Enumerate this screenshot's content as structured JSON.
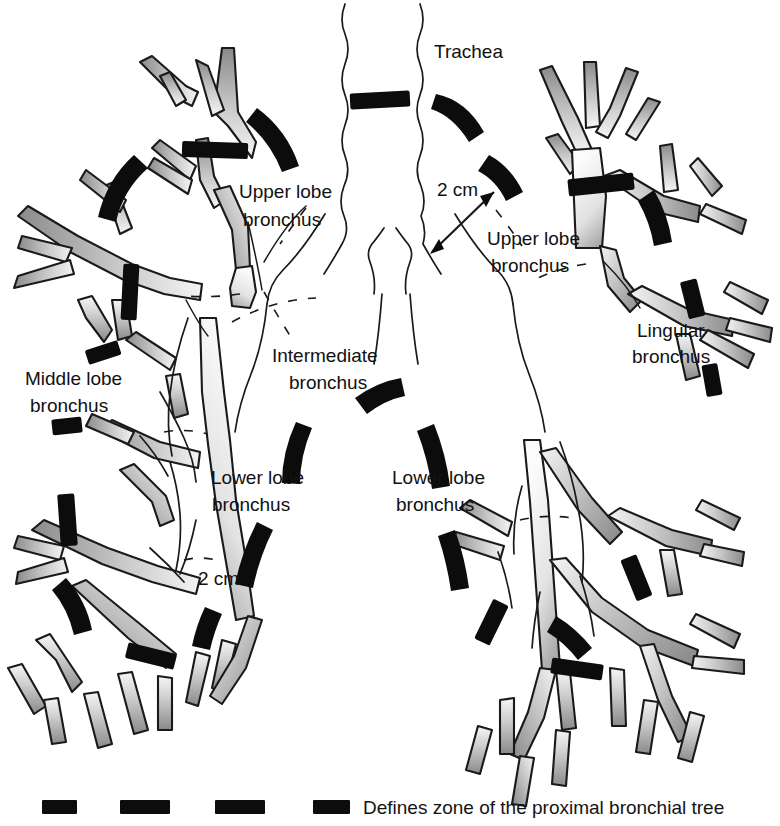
{
  "figure": {
    "background_color": "#ffffff",
    "airway_fill_dark": "#8f8f8f",
    "airway_fill_light": "#f2f2f2",
    "outline_color": "#1a1a1a",
    "marker_color": "#0c0c0c"
  },
  "labels": {
    "trachea": "Trachea",
    "right_upper_lobe_bronchus_line1": "Upper lobe",
    "right_upper_lobe_bronchus_line2": "bronchus",
    "left_upper_lobe_bronchus_line1": "Upper lobe",
    "left_upper_lobe_bronchus_line2": "bronchus",
    "intermediate_bronchus_line1": "Intermediate",
    "intermediate_bronchus_line2": "bronchus",
    "middle_lobe_bronchus_line1": "Middle lobe",
    "middle_lobe_bronchus_line2": "bronchus",
    "lingular_bronchus_line1": "Lingular",
    "lingular_bronchus_line2": "bronchus",
    "right_lower_lobe_bronchus_line1": "Lower lobe",
    "right_lower_lobe_bronchus_line2": "bronchus",
    "left_lower_lobe_bronchus_line1": "Lower lobe",
    "left_lower_lobe_bronchus_line2": "bronchus",
    "scale_upper": "2 cm",
    "scale_lower": "2 cm"
  },
  "legend": {
    "caption": "Defines zone of the proximal bronchial tree",
    "swatch_count": 4,
    "swatch_color": "#0c0c0c"
  }
}
